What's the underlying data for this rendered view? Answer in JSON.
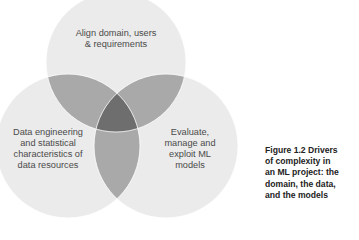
{
  "diagram": {
    "type": "venn",
    "circles": [
      {
        "id": "domain",
        "label": "Align domain, users\n& requirements",
        "cx": 116,
        "cy": 62,
        "r": 70
      },
      {
        "id": "data",
        "label": "Data engineering\nand statistical\ncharacteristics of\ndata resources",
        "cx": 68,
        "cy": 146,
        "r": 72
      },
      {
        "id": "models",
        "label": "Evaluate,\nmanage and\nexploit ML\nmodels",
        "cx": 166,
        "cy": 146,
        "r": 72
      }
    ],
    "colors": {
      "circle_fill": "#ebebeb",
      "pair_overlap": "#a9a9a9",
      "center_overlap": "#6e6e6e",
      "outline": "#ffffff"
    }
  },
  "caption": {
    "text": "Figure 1.2 Drivers\nof complexity in\nan ML project: the\ndomain, the data,\nand the models"
  }
}
